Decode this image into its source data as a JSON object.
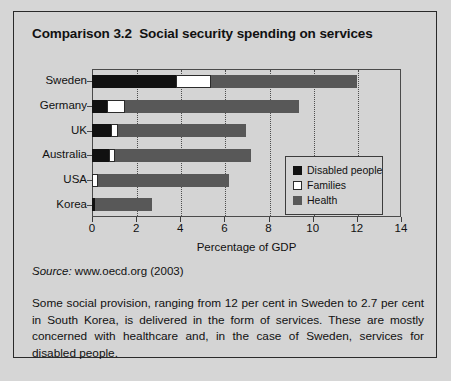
{
  "figure": {
    "title": "Comparison 3.2  Social security spending on services",
    "source_word": "Source:",
    "source_text": " www.oecd.org (2003)",
    "body_text": "Some social provision, ranging from 12 per cent in Sweden to 2.7 per cent in South Korea, is delivered in the form of services. These are mostly concerned with healthcare and, in the case of Sweden, services for disabled people."
  },
  "colors": {
    "disabled": "#111111",
    "families": "#ffffff",
    "health": "#585858",
    "page_background": "#d6d6d6",
    "panel_background": "#d4d4d4",
    "border": "#2a2a2a"
  },
  "chart_data": {
    "type": "bar",
    "orientation": "horizontal",
    "stacked": true,
    "title": "",
    "xlabel": "Percentage of GDP",
    "ylabel": "",
    "xlim": [
      0,
      14
    ],
    "xticks": [
      0,
      2,
      4,
      6,
      8,
      10,
      12,
      14
    ],
    "xtick_labels": [
      "0",
      "2",
      "4",
      "6",
      "8",
      "10",
      "12",
      "14"
    ],
    "grid": "vertical-dotted",
    "legend_position": "center-right-inside",
    "categories": [
      "Sweden",
      "Germany",
      "UK",
      "Australia",
      "USA",
      "Korea"
    ],
    "series": [
      {
        "name": "Disabled people",
        "color": "#111111",
        "values": [
          3.8,
          0.7,
          0.85,
          0.75,
          0.0,
          0.15
        ]
      },
      {
        "name": "Families",
        "color": "#ffffff",
        "values": [
          1.6,
          0.8,
          0.35,
          0.3,
          0.25,
          0.0
        ]
      },
      {
        "name": "Health",
        "color": "#585858",
        "values": [
          6.6,
          7.9,
          5.8,
          6.15,
          5.95,
          2.55
        ]
      }
    ],
    "totals": [
      12.0,
      9.4,
      7.0,
      7.2,
      6.2,
      2.7
    ]
  }
}
